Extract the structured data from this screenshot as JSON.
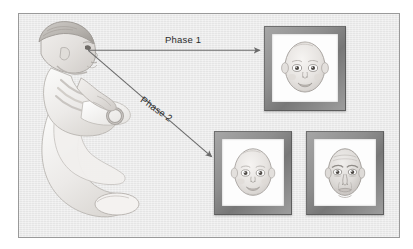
{
  "figure": {
    "background_color": "#ebebeb",
    "border_color": "#9a9a9a"
  },
  "labels": {
    "phase1": "Phase 1",
    "phase2": "Phase 2"
  },
  "arrows": [
    {
      "name": "phase1-arrow",
      "label": "Phase 1",
      "from": "infant",
      "to": "top-framed-baby-face",
      "direction": "horizontal-right",
      "color": "#6b6b6b"
    },
    {
      "name": "phase2-arrow",
      "label": "Phase 2",
      "from": "infant",
      "to": "bottom-left-framed-baby-face",
      "direction": "diagonal-down-right",
      "color": "#6b6b6b"
    }
  ],
  "stimuli": [
    {
      "name": "top-frame",
      "position": "top-right",
      "content": "infant-face",
      "frame_color": "#8c8c8c",
      "mat_color": "#fdfdfd"
    },
    {
      "name": "bottom-left-frame",
      "position": "bottom-center",
      "content": "infant-face",
      "frame_color": "#8c8c8c",
      "mat_color": "#fdfdfd"
    },
    {
      "name": "bottom-right-frame",
      "position": "bottom-right",
      "content": "adult-face",
      "frame_color": "#8c8c8c",
      "mat_color": "#fdfdfd"
    }
  ],
  "subject": {
    "name": "infant",
    "description": "Baby seated in an infant seat holding a ring toy, facing right"
  }
}
